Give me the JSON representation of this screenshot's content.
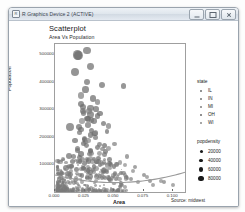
{
  "window": {
    "title": "R Graphics Device 2 (ACTIVE)",
    "icon": "r-logo-icon",
    "buttons": {
      "minimize": "Minimize",
      "maximize": "Maximize",
      "close": "Close"
    }
  },
  "plot": {
    "title": "Scatterplot",
    "subtitle": "Area Vs Population",
    "caption": "Source: midwest"
  },
  "chart_data": {
    "type": "scatter",
    "title": "Scatterplot",
    "subtitle": "Area Vs Population",
    "caption": "Source: midwest",
    "xlabel": "Area",
    "ylabel": "Population",
    "xlim": [
      0.0,
      0.11
    ],
    "ylim": [
      0,
      540000
    ],
    "xticks": [
      "0.000",
      "0.025",
      "0.050",
      "0.075",
      "0.100"
    ],
    "xtick_values": [
      0.0,
      0.025,
      0.05,
      0.075,
      0.1
    ],
    "yticks": [
      "100000",
      "200000",
      "300000",
      "400000",
      "500000"
    ],
    "ytick_values": [
      100000,
      200000,
      300000,
      400000,
      500000
    ],
    "grid": false,
    "legend_position": "right",
    "has_trend_line": true,
    "trend_line_method": "loess",
    "point_color": "#7a7a7a",
    "series": [
      {
        "name": "IL",
        "color": "#6f6f6f",
        "points": [
          [
            0.02,
            498000,
            68000
          ],
          [
            0.027,
            516000,
            44000
          ],
          [
            0.03,
            459000,
            31000
          ],
          [
            0.027,
            402000,
            26000
          ],
          [
            0.04,
            391000,
            21000
          ],
          [
            0.058,
            388000,
            19000
          ],
          [
            0.024,
            310000,
            23000
          ],
          [
            0.03,
            306000,
            22000
          ],
          [
            0.035,
            303000,
            18000
          ],
          [
            0.024,
            288000,
            17000
          ],
          [
            0.03,
            284000,
            36000
          ],
          [
            0.036,
            278000,
            16000
          ],
          [
            0.027,
            268000,
            15000
          ],
          [
            0.033,
            259000,
            14000
          ],
          [
            0.041,
            251000,
            13000
          ],
          [
            0.013,
            238000,
            44000
          ],
          [
            0.022,
            228000,
            12000
          ],
          [
            0.031,
            226000,
            12000
          ],
          [
            0.044,
            219000,
            11000
          ],
          [
            0.03,
            208000,
            12000
          ],
          [
            0.017,
            188000,
            15000
          ],
          [
            0.024,
            176000,
            12000
          ],
          [
            0.027,
            168000,
            11000
          ],
          [
            0.036,
            161000,
            10000
          ],
          [
            0.019,
            150000,
            13000
          ],
          [
            0.043,
            147000,
            9000
          ],
          [
            0.029,
            139000,
            9000
          ],
          [
            0.012,
            132000,
            26000
          ],
          [
            0.021,
            126000,
            10000
          ],
          [
            0.033,
            121000,
            8000
          ],
          [
            0.046,
            118000,
            8000
          ],
          [
            0.015,
            110000,
            12000
          ],
          [
            0.025,
            104000,
            9000
          ],
          [
            0.038,
            99000,
            7000
          ],
          [
            0.05,
            93000,
            7000
          ],
          [
            0.009,
            88000,
            22000
          ],
          [
            0.018,
            83000,
            9000
          ],
          [
            0.028,
            78000,
            8000
          ],
          [
            0.041,
            73000,
            6000
          ],
          [
            0.056,
            70000,
            6000
          ],
          [
            0.013,
            64000,
            10000
          ],
          [
            0.023,
            60000,
            7000
          ]
        ]
      },
      {
        "name": "IN",
        "color": "#757575",
        "points": [
          [
            0.024,
            294000,
            21000
          ],
          [
            0.031,
            262000,
            17000
          ],
          [
            0.028,
            244000,
            15000
          ],
          [
            0.021,
            216000,
            14000
          ],
          [
            0.034,
            198000,
            12000
          ],
          [
            0.026,
            183000,
            12000
          ],
          [
            0.038,
            172000,
            10000
          ],
          [
            0.019,
            159000,
            13000
          ],
          [
            0.03,
            148000,
            10000
          ],
          [
            0.042,
            137000,
            9000
          ],
          [
            0.016,
            128000,
            12000
          ],
          [
            0.027,
            118000,
            9000
          ],
          [
            0.035,
            109000,
            8000
          ],
          [
            0.047,
            101000,
            7000
          ],
          [
            0.014,
            94000,
            11000
          ],
          [
            0.024,
            87000,
            8000
          ],
          [
            0.032,
            80000,
            7000
          ],
          [
            0.044,
            74000,
            6000
          ],
          [
            0.011,
            68000,
            13000
          ],
          [
            0.021,
            62000,
            7000
          ],
          [
            0.03,
            57000,
            6000
          ],
          [
            0.04,
            52000,
            6000
          ],
          [
            0.052,
            48000,
            5000
          ],
          [
            0.018,
            44000,
            7000
          ]
        ]
      },
      {
        "name": "MI",
        "color": "#808080",
        "points": [
          [
            0.022,
            353000,
            27000
          ],
          [
            0.036,
            329000,
            19000
          ],
          [
            0.029,
            296000,
            18000
          ],
          [
            0.045,
            241000,
            13000
          ],
          [
            0.033,
            212000,
            13000
          ],
          [
            0.025,
            194000,
            14000
          ],
          [
            0.05,
            175000,
            10000
          ],
          [
            0.04,
            157000,
            10000
          ],
          [
            0.031,
            142000,
            11000
          ],
          [
            0.061,
            130000,
            8000
          ],
          [
            0.023,
            120000,
            12000
          ],
          [
            0.037,
            110000,
            9000
          ],
          [
            0.052,
            100000,
            7000
          ],
          [
            0.068,
            92000,
            6000
          ],
          [
            0.029,
            84000,
            9000
          ],
          [
            0.043,
            77000,
            7000
          ],
          [
            0.058,
            70000,
            6000
          ],
          [
            0.075,
            63000,
            5000
          ],
          [
            0.035,
            57000,
            7000
          ],
          [
            0.048,
            51000,
            6000
          ],
          [
            0.064,
            46000,
            5000
          ],
          [
            0.08,
            41000,
            5000
          ],
          [
            0.092,
            36000,
            4000
          ]
        ]
      },
      {
        "name": "OH",
        "color": "#6b6b6b",
        "points": [
          [
            0.019,
            499000,
            78000
          ],
          [
            0.017,
            438000,
            62000
          ],
          [
            0.026,
            373000,
            29000
          ],
          [
            0.032,
            341000,
            24000
          ],
          [
            0.022,
            322000,
            25000
          ],
          [
            0.038,
            286000,
            18000
          ],
          [
            0.028,
            265000,
            19000
          ],
          [
            0.02,
            238000,
            22000
          ],
          [
            0.034,
            213000,
            15000
          ],
          [
            0.025,
            191000,
            16000
          ],
          [
            0.042,
            170000,
            12000
          ],
          [
            0.03,
            152000,
            13000
          ],
          [
            0.022,
            138000,
            16000
          ],
          [
            0.037,
            124000,
            11000
          ],
          [
            0.028,
            113000,
            12000
          ],
          [
            0.046,
            103000,
            9000
          ],
          [
            0.033,
            94000,
            10000
          ],
          [
            0.024,
            86000,
            12000
          ],
          [
            0.041,
            78000,
            8000
          ],
          [
            0.03,
            71000,
            9000
          ],
          [
            0.051,
            65000,
            7000
          ],
          [
            0.038,
            59000,
            7000
          ],
          [
            0.027,
            54000,
            9000
          ],
          [
            0.046,
            49000,
            6000
          ]
        ]
      },
      {
        "name": "WI",
        "color": "#8a8a8a",
        "points": [
          [
            0.023,
            260000,
            16000
          ],
          [
            0.034,
            217000,
            13000
          ],
          [
            0.028,
            188000,
            13000
          ],
          [
            0.045,
            159000,
            10000
          ],
          [
            0.038,
            139000,
            10000
          ],
          [
            0.03,
            122000,
            11000
          ],
          [
            0.055,
            108000,
            8000
          ],
          [
            0.044,
            96000,
            8000
          ],
          [
            0.035,
            86000,
            9000
          ],
          [
            0.066,
            77000,
            6000
          ],
          [
            0.051,
            69000,
            7000
          ],
          [
            0.04,
            62000,
            7000
          ],
          [
            0.078,
            55000,
            5000
          ],
          [
            0.06,
            49000,
            6000
          ],
          [
            0.047,
            44000,
            6000
          ],
          [
            0.09,
            39000,
            4000
          ],
          [
            0.07,
            35000,
            5000
          ],
          [
            0.056,
            31000,
            5000
          ],
          [
            0.1,
            27000,
            4000
          ],
          [
            0.083,
            24000,
            4000
          ]
        ]
      }
    ]
  },
  "legends": {
    "state": {
      "title": "state",
      "items": [
        {
          "label": "IL",
          "color": "#6f6f6f"
        },
        {
          "label": "IN",
          "color": "#757575"
        },
        {
          "label": "MI",
          "color": "#808080"
        },
        {
          "label": "OH",
          "color": "#6b6b6b"
        },
        {
          "label": "WI",
          "color": "#8a8a8a"
        }
      ]
    },
    "popdensity": {
      "title": "popdensity",
      "items": [
        {
          "label": "20000",
          "size": 3.0
        },
        {
          "label": "40000",
          "size": 3.8
        },
        {
          "label": "60000",
          "size": 4.6
        },
        {
          "label": "80000",
          "size": 5.4
        }
      ]
    }
  }
}
